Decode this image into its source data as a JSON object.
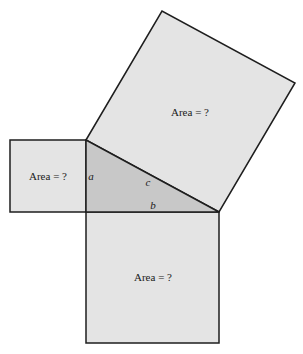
{
  "diagram": {
    "type": "pythagorean-theorem",
    "colors": {
      "square_fill": "#e4e4e4",
      "triangle_fill": "#c8c8c8",
      "stroke": "#1e1e1e",
      "background": "#ffffff"
    },
    "squares": [
      {
        "id": "square-a",
        "side": "a",
        "label": "Area = ?"
      },
      {
        "id": "square-b",
        "side": "b",
        "label": "Area = ?"
      },
      {
        "id": "square-c",
        "side": "c",
        "label": "Area = ?"
      }
    ],
    "triangle": {
      "sides": {
        "a": "a",
        "b": "b",
        "c": "c"
      }
    }
  }
}
